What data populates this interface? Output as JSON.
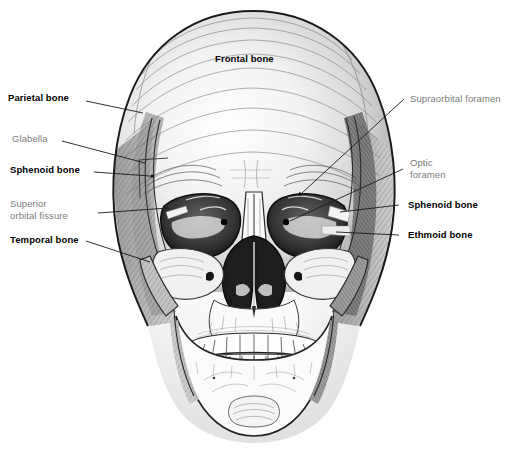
{
  "figure": {
    "background_color": "#ffffff",
    "ink_color": "#1a1a1a",
    "bold_label_color": "#000000",
    "gray_label_color": "#7b7b7b",
    "width": 508,
    "height": 467
  },
  "labels": {
    "frontal_bone": "Frontal bone",
    "parietal_bone": "Parietal bone",
    "glabella": "Glabella",
    "sphenoid_bone_left": "Sphenoid bone",
    "superior_orbital_fissure_line1": "Superior",
    "superior_orbital_fissure_line2": "orbital fissure",
    "temporal_bone": "Temporal bone",
    "supraorbital_foramen": "Supraorbital foramen",
    "optic_foramen_line1": "Optic",
    "optic_foramen_line2": "foramen",
    "sphenoid_bone_right": "Sphenoid bone",
    "ethmoid_bone": "Ethmoid bone"
  }
}
